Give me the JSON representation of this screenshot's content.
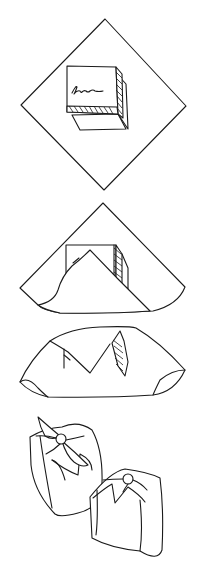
{
  "illustration": {
    "subject": "furoshiki gift wrapping steps",
    "steps": [
      {
        "id": 1,
        "description": "box placed diagonally on square cloth"
      },
      {
        "id": 2,
        "description": "front corner folded over box"
      },
      {
        "id": 3,
        "description": "back corner folded over box"
      },
      {
        "id": 4,
        "description": "two finished wrapped bundles with knots"
      }
    ],
    "colors": {
      "line": "#1a1a1a",
      "background": "#ffffff"
    }
  }
}
